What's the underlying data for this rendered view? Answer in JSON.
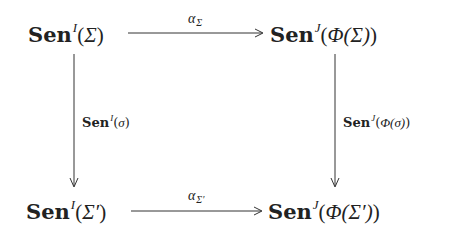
{
  "diagram": {
    "type": "commutative-square",
    "nodes": {
      "top_left": {
        "functor": "Sen",
        "superscript": "I",
        "argument": "Σ",
        "open": "(",
        "close": ")"
      },
      "top_right": {
        "functor": "Sen",
        "superscript": "J",
        "argument": "Φ(Σ)",
        "open": "(",
        "close": ")"
      },
      "bottom_left": {
        "functor": "Sen",
        "superscript": "I",
        "argument": "Σ′",
        "open": "(",
        "close": ")"
      },
      "bottom_right": {
        "functor": "Sen",
        "superscript": "J",
        "argument": "Φ(Σ′)",
        "open": "(",
        "close": ")"
      }
    },
    "arrows": {
      "top": {
        "from": "top_left",
        "to": "top_right",
        "label": "α",
        "label_subscript": "Σ"
      },
      "bottom": {
        "from": "bottom_left",
        "to": "bottom_right",
        "label": "α",
        "label_subscript": "Σ′"
      },
      "left": {
        "from": "top_left",
        "to": "bottom_left",
        "label_functor": "Sen",
        "label_superscript": "I",
        "label_argument": "σ"
      },
      "right": {
        "from": "top_right",
        "to": "bottom_right",
        "label_functor": "Sen",
        "label_superscript": "J",
        "label_argument": "Φ(σ)"
      }
    },
    "colors": {
      "ink": "#222222",
      "background": "#ffffff"
    }
  }
}
